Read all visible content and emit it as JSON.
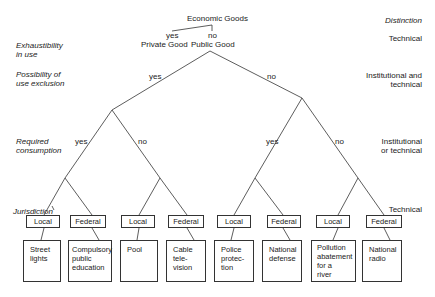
{
  "root": {
    "label": "Economic Goods"
  },
  "level1": {
    "yes_label": "yes",
    "no_label": "no",
    "private": "Private Good",
    "public": "Public Good"
  },
  "level2": {
    "yes_label": "yes",
    "no_label": "no"
  },
  "level3": {
    "left_yes": "yes",
    "left_no": "no",
    "right_yes": "yes",
    "right_no": "no"
  },
  "criteria": {
    "header": "Distinction",
    "rows": [
      {
        "criterion": "Exhaustibility\nin use",
        "distinction": "Technical"
      },
      {
        "criterion": "Possibility of\nuse exclusion",
        "distinction": "Institutional and\ntechnical"
      },
      {
        "criterion": "Required\nconsumption",
        "distinction": "Institutional\nor technical"
      },
      {
        "criterion": "Jurisdiction",
        "distinction": "Technical"
      }
    ]
  },
  "jurisdiction_boxes": [
    "Local",
    "Federal",
    "Local",
    "Federal",
    "Local",
    "Federal",
    "Local",
    "Federal"
  ],
  "leaves": [
    "Street\nlights",
    "Compulsory\npublic\neducation",
    "Pool",
    "Cable\ntele-\nvision",
    "Police\nprotec-\ntion",
    "National\ndefense",
    "Pollution\nabatement\nfor a\nriver",
    "National\nradio"
  ]
}
